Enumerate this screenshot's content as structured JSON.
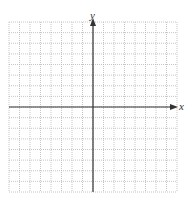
{
  "diagram": {
    "type": "coordinate-plane",
    "x_axis_label": "x",
    "y_axis_label": "y",
    "grid": {
      "columns": 16,
      "rows": 16,
      "x_min": -8,
      "x_max": 8,
      "y_min": -8,
      "y_max": 8,
      "line_style": "dotted",
      "line_color": "#b8b8b8"
    },
    "axis_color": "#333333",
    "arrows": [
      "positive-x",
      "positive-y"
    ]
  }
}
